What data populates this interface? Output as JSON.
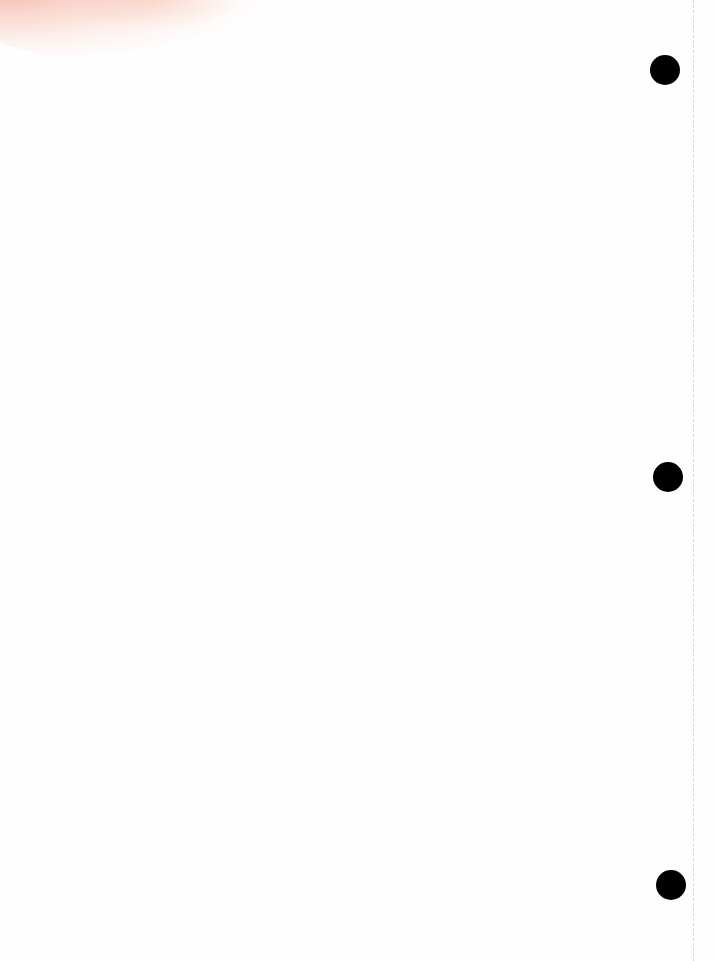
{
  "page": {
    "background_color": "#fefefe",
    "text_content": ""
  },
  "stain": {
    "color": "#f29a84",
    "position": "top-left"
  },
  "punch_holes": [
    {
      "cx": 665,
      "cy": 70,
      "r": 15
    },
    {
      "cx": 668,
      "cy": 477,
      "r": 15
    },
    {
      "cx": 671,
      "cy": 885,
      "r": 15
    }
  ],
  "fold_line": {
    "x": 693,
    "style": "dashed",
    "color": "#d6d6d6"
  }
}
